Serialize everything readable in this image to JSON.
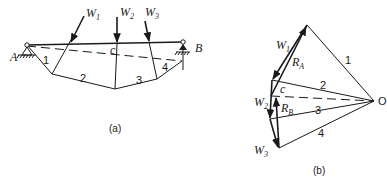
{
  "figure_a": {
    "caption": "(a)",
    "support_left": "A",
    "support_right": "B",
    "loads": [
      {
        "label": "W",
        "sub": "1"
      },
      {
        "label": "W",
        "sub": "2"
      },
      {
        "label": "W",
        "sub": "3"
      }
    ],
    "closing_line_label": "c",
    "segments": [
      "1",
      "2",
      "3",
      "4"
    ]
  },
  "figure_b": {
    "caption": "(b)",
    "pole": "O",
    "forces": [
      {
        "label": "W",
        "sub": "1"
      },
      {
        "label": "W",
        "sub": "2"
      },
      {
        "label": "W",
        "sub": "3"
      }
    ],
    "reactions": [
      {
        "label": "R",
        "sub": "A"
      },
      {
        "label": "R",
        "sub": "B"
      }
    ],
    "closing_ray_label": "c",
    "rays": [
      "1",
      "2",
      "3",
      "4"
    ]
  }
}
